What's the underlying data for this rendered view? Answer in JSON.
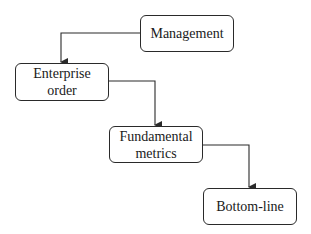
{
  "diagram": {
    "type": "flowchart",
    "direction": "top-left to bottom-right staircase",
    "nodes": [
      {
        "id": "management",
        "label": "Management"
      },
      {
        "id": "enterprise",
        "label": "Enterprise order"
      },
      {
        "id": "fundamental",
        "label": "Fundamental metrics"
      },
      {
        "id": "bottomline",
        "label": "Bottom-line"
      }
    ],
    "edges": [
      {
        "from": "management",
        "to": "enterprise"
      },
      {
        "from": "enterprise",
        "to": "fundamental"
      },
      {
        "from": "fundamental",
        "to": "bottomline"
      }
    ],
    "colors": {
      "stroke": "#2a2a2a",
      "background": "#ffffff",
      "text": "#1a1a1a"
    }
  }
}
